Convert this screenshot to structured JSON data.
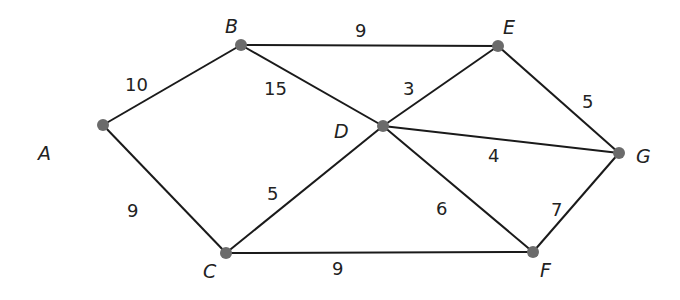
{
  "graph": {
    "type": "weighted-undirected-graph",
    "node_color": "#6b6b6b",
    "edge_color": "#1a1a1a",
    "nodes": [
      {
        "id": "A",
        "label": "A",
        "x": 103,
        "y": 125,
        "lx": 38,
        "ly": 160
      },
      {
        "id": "B",
        "label": "B",
        "x": 241,
        "y": 45,
        "lx": 225,
        "ly": 33
      },
      {
        "id": "C",
        "label": "C",
        "x": 226,
        "y": 253,
        "lx": 203,
        "ly": 278
      },
      {
        "id": "D",
        "label": "D",
        "x": 383,
        "y": 126,
        "lx": 334,
        "ly": 138
      },
      {
        "id": "E",
        "label": "E",
        "x": 498,
        "y": 46,
        "lx": 503,
        "ly": 34
      },
      {
        "id": "F",
        "label": "F",
        "x": 533,
        "y": 252,
        "lx": 540,
        "ly": 277
      },
      {
        "id": "G",
        "label": "G",
        "x": 619,
        "y": 153,
        "lx": 636,
        "ly": 163
      }
    ],
    "edges": [
      {
        "from": "A",
        "to": "B",
        "weight": "10",
        "wx": 125,
        "wy": 91
      },
      {
        "from": "A",
        "to": "C",
        "weight": "9",
        "wx": 127,
        "wy": 217
      },
      {
        "from": "B",
        "to": "E",
        "weight": "9",
        "wx": 355,
        "wy": 37
      },
      {
        "from": "B",
        "to": "D",
        "weight": "15",
        "wx": 264,
        "wy": 95
      },
      {
        "from": "D",
        "to": "E",
        "weight": "3",
        "wx": 403,
        "wy": 95
      },
      {
        "from": "E",
        "to": "G",
        "weight": "5",
        "wx": 582,
        "wy": 108
      },
      {
        "from": "D",
        "to": "G",
        "weight": "4",
        "wx": 488,
        "wy": 162
      },
      {
        "from": "C",
        "to": "D",
        "weight": "5",
        "wx": 267,
        "wy": 200
      },
      {
        "from": "D",
        "to": "F",
        "weight": "6",
        "wx": 436,
        "wy": 215
      },
      {
        "from": "F",
        "to": "G",
        "weight": "7",
        "wx": 551,
        "wy": 216
      },
      {
        "from": "C",
        "to": "F",
        "weight": "9",
        "wx": 332,
        "wy": 275
      }
    ]
  }
}
